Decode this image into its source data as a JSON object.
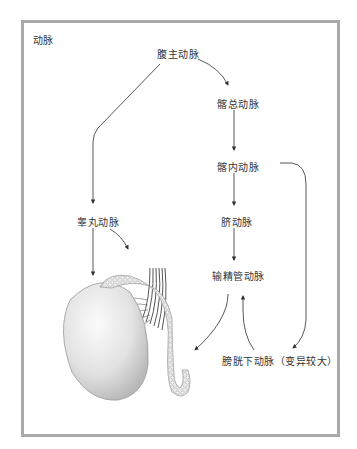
{
  "diagram": {
    "title": "动脉",
    "nodes": {
      "abdominal_aorta": "腹主动脉",
      "common_iliac": "髂总动脉",
      "internal_iliac": "髂内动脉",
      "umbilical": "脐动脉",
      "deferential": "输精管动脉",
      "testicular": "睾丸动脉",
      "inferior_vesical": "膀胱下动脉（变异较大）"
    },
    "edges": [
      {
        "from": "腹主动脉",
        "to": "髂总动脉"
      },
      {
        "from": "腹主动脉",
        "to": "睾丸动脉"
      },
      {
        "from": "髂总动脉",
        "to": "髂内动脉"
      },
      {
        "from": "髂内动脉",
        "to": "脐动脉"
      },
      {
        "from": "髂内动脉",
        "to": "膀胱下动脉（变异较大）"
      },
      {
        "from": "脐动脉",
        "to": "输精管动脉"
      },
      {
        "from": "膀胱下动脉（变异较大）",
        "to": "输精管动脉"
      },
      {
        "from": "睾丸动脉",
        "to": "testis"
      },
      {
        "from": "睾丸动脉",
        "to": "epididymis"
      },
      {
        "from": "输精管动脉",
        "to": "vas-deferens"
      }
    ],
    "colors": {
      "frame": "#a9a9a9",
      "arrow": "#333333",
      "text": "#333333"
    }
  }
}
